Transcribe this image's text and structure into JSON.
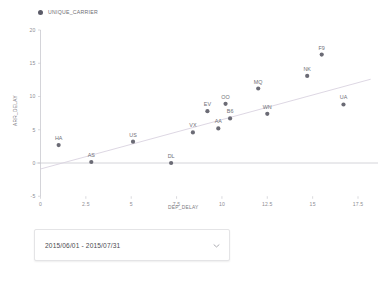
{
  "legend": {
    "label": "UNIQUE_CARRIER",
    "marker_color": "#5b5b68"
  },
  "filter": {
    "date_range_value": "2015/06/01 - 2015/07/31",
    "caret_icon": "chevron-down-icon"
  },
  "chart_data": {
    "type": "scatter",
    "title": "",
    "xlabel": "DEP_DELAY",
    "ylabel": "ARR_DELAY",
    "xlim": [
      0,
      18.2
    ],
    "ylim": [
      -5,
      20
    ],
    "xticks": [
      "0",
      "2.5",
      "5",
      "7.5",
      "10",
      "12.5",
      "15",
      "17.5"
    ],
    "xtick_values": [
      0,
      2.5,
      5,
      7.5,
      10,
      12.5,
      15,
      17.5
    ],
    "yticks": [
      "20",
      "15",
      "10",
      "5",
      "0",
      "-5"
    ],
    "ytick_values": [
      20,
      15,
      10,
      5,
      0,
      -5
    ],
    "grid": false,
    "legend_position": "top-left",
    "series_name": "UNIQUE_CARRIER",
    "point_color": "#6b6b75",
    "trendline": {
      "visible": true,
      "color": "#d9d2e0",
      "x0": 0.0,
      "y0": -0.9,
      "x1": 18.2,
      "y1": 12.6
    },
    "points": [
      {
        "label": "HA",
        "x": 1.0,
        "y": 2.7
      },
      {
        "label": "AS",
        "x": 2.8,
        "y": 0.15
      },
      {
        "label": "US",
        "x": 5.1,
        "y": 3.2
      },
      {
        "label": "DL",
        "x": 7.2,
        "y": 0.0
      },
      {
        "label": "VX",
        "x": 8.4,
        "y": 4.6
      },
      {
        "label": "EV",
        "x": 9.2,
        "y": 7.8
      },
      {
        "label": "AA",
        "x": 9.8,
        "y": 5.2
      },
      {
        "label": "OO",
        "x": 10.2,
        "y": 8.9
      },
      {
        "label": "B6",
        "x": 10.45,
        "y": 6.7
      },
      {
        "label": "MQ",
        "x": 12.0,
        "y": 11.2
      },
      {
        "label": "WN",
        "x": 12.5,
        "y": 7.4
      },
      {
        "label": "NK",
        "x": 14.7,
        "y": 13.1
      },
      {
        "label": "F9",
        "x": 15.5,
        "y": 16.3
      },
      {
        "label": "UA",
        "x": 16.7,
        "y": 8.8
      }
    ]
  }
}
